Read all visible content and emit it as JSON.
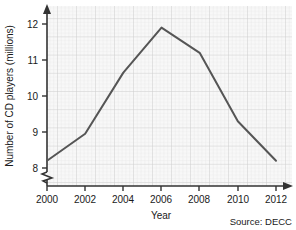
{
  "chart_data": {
    "type": "line",
    "title": "",
    "xlabel": "Year",
    "ylabel": "Number of CD players (millions)",
    "x": [
      2000,
      2002,
      2004,
      2006,
      2008,
      2010,
      2012
    ],
    "values": [
      8.2,
      8.95,
      10.65,
      11.9,
      11.2,
      9.3,
      8.2
    ],
    "series": [
      {
        "name": "Number of CD players",
        "values": [
          8.2,
          8.95,
          10.65,
          11.9,
          11.2,
          9.3,
          8.2
        ]
      }
    ],
    "x_tick_labels": [
      "2000",
      "2002",
      "2004",
      "2006",
      "2008",
      "2010",
      "2012"
    ],
    "y_tick_labels": [
      "8",
      "9",
      "10",
      "11",
      "12"
    ],
    "y_ticks": [
      8,
      9,
      10,
      11,
      12
    ],
    "xlim": [
      2000,
      2012
    ],
    "ylim": [
      8,
      12
    ],
    "grid": true,
    "legend": null,
    "y_axis_break": true,
    "annotation": "Source: DECC",
    "line_color": "#555555",
    "grid_color": "#d8d8d8",
    "grid_minor_color": "#e8e8e8",
    "axis_color": "#333333",
    "plot_background": "#f7f7f7"
  },
  "labels": {
    "y_axis_title": "Number of CD players (millions)",
    "x_axis_title": "Year",
    "source": "Source: DECC",
    "y_12": "12",
    "y_11": "11",
    "y_10": "10",
    "y_9": "9",
    "y_8": "8",
    "x_2000": "2000",
    "x_2002": "2002",
    "x_2004": "2004",
    "x_2006": "2006",
    "x_2008": "2008",
    "x_2010": "2010",
    "x_2012": "2012"
  }
}
